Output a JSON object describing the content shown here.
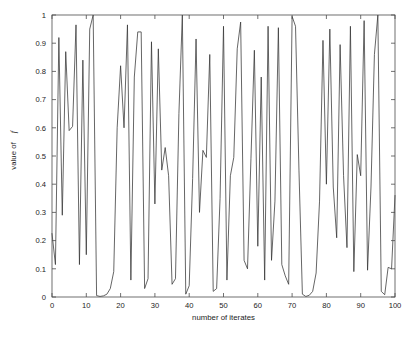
{
  "chart_data": {
    "type": "line",
    "title": "",
    "xlabel": "number of iterates",
    "ylabel": "value of f",
    "ylabel_parts": {
      "prefix": "value of ",
      "symbol": "f"
    },
    "xlim": [
      0,
      100
    ],
    "ylim": [
      0,
      1
    ],
    "xticks": [
      0,
      10,
      20,
      30,
      40,
      50,
      60,
      70,
      80,
      90,
      100
    ],
    "xtick_labels": [
      "0",
      "10",
      "20",
      "30",
      "40",
      "50",
      "60",
      "70",
      "80",
      "90",
      "100"
    ],
    "yticks": [
      0,
      0.1,
      0.2,
      0.3,
      0.4,
      0.5,
      0.6,
      0.7,
      0.8,
      0.9,
      1
    ],
    "ytick_labels": [
      "0",
      "0.1",
      "0.2",
      "0.3",
      "0.4",
      "0.5",
      "0.6",
      "0.7",
      "0.8",
      "0.9",
      "1"
    ],
    "grid": false,
    "legend": null,
    "box": true,
    "line_color": "#333333",
    "background_color": "#ffffff",
    "axis_color": "#4c4c4c",
    "x": [
      0,
      1,
      2,
      3,
      4,
      5,
      6,
      7,
      8,
      9,
      10,
      11,
      12,
      13,
      14,
      15,
      16,
      17,
      18,
      19,
      20,
      21,
      22,
      23,
      24,
      25,
      26,
      27,
      28,
      29,
      30,
      31,
      32,
      33,
      34,
      35,
      36,
      37,
      38,
      39,
      40,
      41,
      42,
      43,
      44,
      45,
      46,
      47,
      48,
      49,
      50,
      51,
      52,
      53,
      54,
      55,
      56,
      57,
      58,
      59,
      60,
      61,
      62,
      63,
      64,
      65,
      66,
      67,
      68,
      69,
      70,
      71,
      72,
      73,
      74,
      75,
      76,
      77,
      78,
      79,
      80,
      81,
      82,
      83,
      84,
      85,
      86,
      87,
      88,
      89,
      90,
      91,
      92,
      93,
      94,
      95,
      96,
      97,
      98,
      99,
      100
    ],
    "series": [
      {
        "name": "f",
        "values": [
          0.225,
          0.115,
          0.92,
          0.29,
          0.87,
          0.59,
          0.605,
          0.965,
          0.115,
          0.84,
          0.15,
          0.95,
          1.0,
          0.005,
          0.002,
          0.004,
          0.01,
          0.03,
          0.09,
          0.6,
          0.82,
          0.6,
          0.965,
          0.06,
          0.78,
          0.94,
          0.94,
          0.03,
          0.065,
          0.905,
          0.33,
          0.88,
          0.45,
          0.53,
          0.43,
          0.045,
          0.065,
          0.65,
          1.0,
          0.01,
          0.04,
          0.42,
          0.915,
          0.3,
          0.52,
          0.495,
          0.86,
          0.02,
          0.03,
          0.35,
          0.96,
          0.06,
          0.43,
          0.495,
          0.88,
          0.975,
          0.13,
          0.1,
          0.49,
          0.875,
          0.18,
          0.78,
          0.06,
          0.96,
          0.13,
          0.34,
          0.955,
          0.115,
          0.075,
          0.045,
          0.995,
          0.96,
          0.45,
          0.01,
          0.002,
          0.006,
          0.02,
          0.085,
          0.34,
          0.91,
          0.4,
          0.95,
          0.39,
          0.21,
          0.895,
          0.43,
          0.175,
          0.96,
          0.09,
          0.505,
          0.43,
          0.98,
          0.095,
          0.39,
          0.86,
          1.0,
          0.02,
          0.008,
          0.105,
          0.1,
          0.36
        ]
      }
    ]
  },
  "axes": {
    "ylabel_text": "value of",
    "ylabel_symbol": "f",
    "xlabel_text": "number of iterates"
  }
}
